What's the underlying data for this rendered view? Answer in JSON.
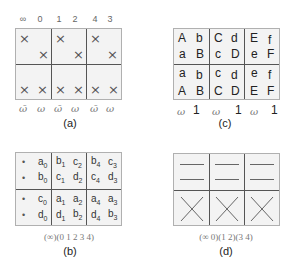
{
  "panels": {
    "a": {
      "caption": "(a)",
      "top_labels": [
        "∞",
        "0",
        "1",
        "2",
        "4",
        "3"
      ],
      "bottom_labels": [
        "ω̄",
        "ω",
        "ω̄",
        "ω",
        "ω̄",
        "ω"
      ],
      "top_row_marks": [
        "×",
        "×",
        "×",
        "×",
        "×",
        "×"
      ],
      "bottom_row_marks": [
        "×",
        "×",
        "×",
        "×",
        "×",
        "×"
      ]
    },
    "b": {
      "caption": "(b)",
      "permutation": "(∞)(0 1 2 3 4)",
      "cells": {
        "col0": {
          "r0": [
            "•",
            "a",
            "0"
          ],
          "r1": [
            "•",
            "b",
            "0"
          ],
          "r2": [
            "•",
            "c",
            "0"
          ],
          "r3": [
            "•",
            "d",
            "0"
          ]
        },
        "col1": {
          "r0": [
            [
              "b",
              "1"
            ],
            [
              "c",
              "2"
            ]
          ],
          "r1": [
            [
              "c",
              "1"
            ],
            [
              "d",
              "2"
            ]
          ],
          "r2": [
            [
              "a",
              "1"
            ],
            [
              "a",
              "2"
            ]
          ],
          "r3": [
            [
              "d",
              "1"
            ],
            [
              "b",
              "2"
            ]
          ]
        },
        "col2": {
          "r0": [
            [
              "b",
              "4"
            ],
            [
              "c",
              "3"
            ]
          ],
          "r1": [
            [
              "c",
              "4"
            ],
            [
              "d",
              "3"
            ]
          ],
          "r2": [
            [
              "a",
              "4"
            ],
            [
              "a",
              "3"
            ]
          ],
          "r3": [
            [
              "d",
              "4"
            ],
            [
              "b",
              "3"
            ]
          ]
        }
      }
    },
    "c": {
      "caption": "(c)",
      "rows": [
        [
          "A",
          "b",
          "C",
          "d",
          "E",
          "f"
        ],
        [
          "a",
          "B",
          "c",
          "D",
          "e",
          "F"
        ],
        [
          "a",
          "b",
          "c",
          "d",
          "e",
          "f"
        ],
        [
          "A",
          "B",
          "C",
          "D",
          "E",
          "F"
        ]
      ],
      "bottom_labels": [
        "ω",
        "1",
        "ω",
        "1",
        "ω",
        "1"
      ]
    },
    "d": {
      "caption": "(d)",
      "permutation": "(∞ 0)(1 2)(3 4)",
      "top_row": "double-dash",
      "bottom_row": "cross"
    }
  }
}
